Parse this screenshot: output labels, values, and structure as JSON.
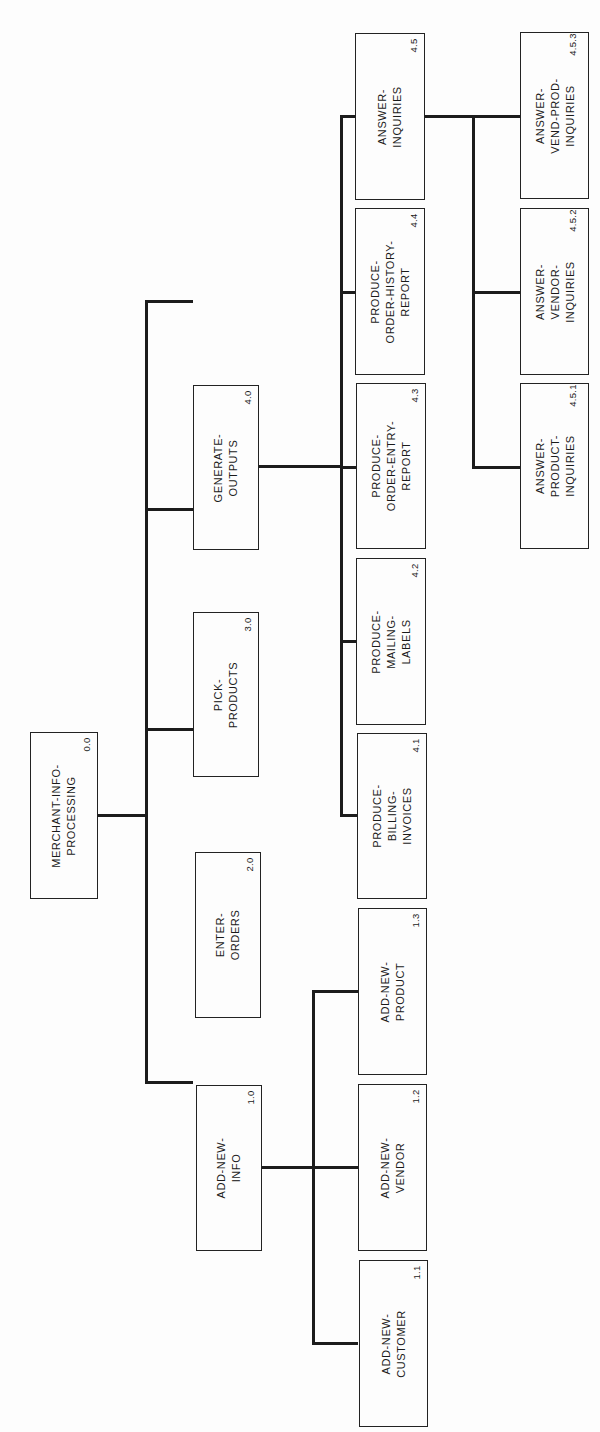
{
  "diagram": {
    "type": "hierarchy-chart",
    "orientation": "rotated-90-ccw",
    "root": {
      "label": "MERCHANT-INFO-\nPROCESSING",
      "number": "0.0"
    },
    "level1": [
      {
        "id": "n40",
        "label": "GENERATE-\nOUTPUTS",
        "number": "4.0"
      },
      {
        "id": "n30",
        "label": "PICK-\nPRODUCTS",
        "number": "3.0"
      },
      {
        "id": "n20",
        "label": "ENTER-\nORDERS",
        "number": "2.0"
      },
      {
        "id": "n10",
        "label": "ADD-NEW-\nINFO",
        "number": "1.0"
      }
    ],
    "outputs_children": [
      {
        "id": "n45",
        "label": "ANSWER-\nINQUIRIES",
        "number": "4.5"
      },
      {
        "id": "n44",
        "label": "PRODUCE-\nORDER-HISTORY-\nREPORT",
        "number": "4.4"
      },
      {
        "id": "n43",
        "label": "PRODUCE-\nORDER-ENTRY-\nREPORT",
        "number": "4.3"
      },
      {
        "id": "n42",
        "label": "PRODUCE-\nMAILING-\nLABELS",
        "number": "4.2"
      },
      {
        "id": "n41",
        "label": "PRODUCE-\nBILLING-\nINVOICES",
        "number": "4.1"
      }
    ],
    "info_children": [
      {
        "id": "n13",
        "label": "ADD-NEW-\nPRODUCT",
        "number": "1.3"
      },
      {
        "id": "n12",
        "label": "ADD-NEW-\nVENDOR",
        "number": "1.2"
      },
      {
        "id": "n11",
        "label": "ADD-NEW-\nCUSTOMER",
        "number": "1.1"
      }
    ],
    "inquiries_children": [
      {
        "id": "n453",
        "label": "ANSWER-\nVEND-PROD-\nINQUIRIES",
        "number": "4.5.3"
      },
      {
        "id": "n452",
        "label": "ANSWER-\nVENDOR-\nINQUIRIES",
        "number": "4.5.2"
      },
      {
        "id": "n451",
        "label": "ANSWER-\nPRODUCT-\nINQUIRIES",
        "number": "4.5.1"
      }
    ]
  }
}
